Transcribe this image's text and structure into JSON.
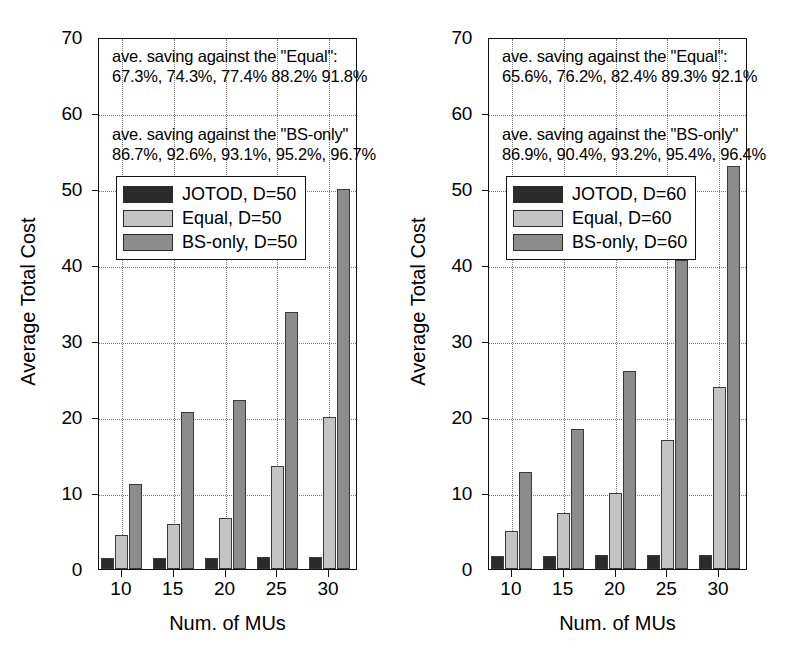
{
  "figure": {
    "panels": [
      {
        "id": "left",
        "axis": {
          "ylabel": "Average Total Cost",
          "xlabel": "Num. of MUs",
          "yticks": [
            0,
            10,
            20,
            30,
            40,
            50,
            60,
            70
          ],
          "ylim": [
            0,
            70
          ],
          "xticklabels": [
            "10",
            "15",
            "20",
            "25",
            "30"
          ]
        },
        "annotations": {
          "equal_header": "ave. saving against the \"Equal\":",
          "equal_values": "67.3%, 74.3%, 77.4% 88.2% 91.8%",
          "bsonly_header": "ave. saving against the \"BS-only\"",
          "bsonly_values": "86.7%, 92.6%, 93.1%, 95.2%, 96.7%"
        },
        "legend": [
          {
            "label": "JOTOD, D=50",
            "color": "#2b2b2b"
          },
          {
            "label": "Equal, D=50",
            "color": "#c4c4c4"
          },
          {
            "label": "BS-only, D=50",
            "color": "#8c8c8c"
          }
        ]
      },
      {
        "id": "right",
        "axis": {
          "ylabel": "Average Total Cost",
          "xlabel": "Num. of MUs",
          "yticks": [
            0,
            10,
            20,
            30,
            40,
            50,
            60,
            70
          ],
          "ylim": [
            0,
            70
          ],
          "xticklabels": [
            "10",
            "15",
            "20",
            "25",
            "30"
          ]
        },
        "annotations": {
          "equal_header": "ave. saving against the \"Equal\":",
          "equal_values": "65.6%, 76.2%, 82.4% 89.3% 92.1%",
          "bsonly_header": "ave. saving against the \"BS-only\"",
          "bsonly_values": "86.9%, 90.4%, 93.2%, 95.4%, 96.4%"
        },
        "legend": [
          {
            "label": "JOTOD, D=60",
            "color": "#2b2b2b"
          },
          {
            "label": "Equal, D=60",
            "color": "#c4c4c4"
          },
          {
            "label": "BS-only, D=60",
            "color": "#8c8c8c"
          }
        ]
      }
    ]
  },
  "chart_data": [
    {
      "type": "bar",
      "title": "",
      "xlabel": "Num. of MUs",
      "ylabel": "Average Total Cost",
      "categories": [
        "10",
        "15",
        "20",
        "25",
        "30"
      ],
      "ylim": [
        0,
        70
      ],
      "yticks": [
        0,
        10,
        20,
        30,
        40,
        50,
        60,
        70
      ],
      "grid": true,
      "legend_position": "upper left",
      "series": [
        {
          "name": "JOTOD, D=50",
          "color": "#2b2b2b",
          "values": [
            1.4,
            1.5,
            1.5,
            1.6,
            1.6
          ]
        },
        {
          "name": "Equal, D=50",
          "color": "#c4c4c4",
          "values": [
            4.5,
            5.9,
            6.7,
            13.5,
            20.0
          ]
        },
        {
          "name": "BS-only, D=50",
          "color": "#8c8c8c",
          "values": [
            11.2,
            20.7,
            22.3,
            33.8,
            50.0
          ]
        }
      ],
      "annotations": [
        "ave. saving against the \"Equal\":",
        "67.3%, 74.3%, 77.4% 88.2% 91.8%",
        "ave. saving against the \"BS-only\"",
        "86.7%, 92.6%, 93.1%, 95.2%, 96.7%"
      ]
    },
    {
      "type": "bar",
      "title": "",
      "xlabel": "Num. of MUs",
      "ylabel": "Average Total Cost",
      "categories": [
        "10",
        "15",
        "20",
        "25",
        "30"
      ],
      "ylim": [
        0,
        70
      ],
      "yticks": [
        0,
        10,
        20,
        30,
        40,
        50,
        60,
        70
      ],
      "grid": true,
      "legend_position": "upper left",
      "series": [
        {
          "name": "JOTOD, D=60",
          "color": "#2b2b2b",
          "values": [
            1.7,
            1.7,
            1.8,
            1.8,
            1.9
          ]
        },
        {
          "name": "Equal, D=60",
          "color": "#c4c4c4",
          "values": [
            5.0,
            7.4,
            10.0,
            17.0,
            24.0
          ]
        },
        {
          "name": "BS-only, D=60",
          "color": "#8c8c8c",
          "values": [
            12.8,
            18.4,
            26.0,
            40.6,
            53.0
          ]
        }
      ],
      "annotations": [
        "ave. saving against the \"Equal\":",
        "65.6%, 76.2%, 82.4% 89.3% 92.1%",
        "ave. saving against the \"BS-only\"",
        "86.9%, 90.4%, 93.2%, 95.4%, 96.4%"
      ]
    }
  ]
}
